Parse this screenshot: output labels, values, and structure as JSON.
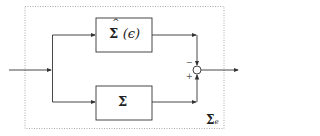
{
  "diagram": {
    "outer_label": "Σ",
    "outer_label_sub": "e",
    "top_block": {
      "symbol": "Σ",
      "hat": "^",
      "arg": "(ϵ)"
    },
    "bottom_block": {
      "symbol": "Σ"
    },
    "junction": {
      "top_sign": "−",
      "bottom_sign": "+"
    }
  },
  "colors": {
    "line": "#333333",
    "dashed": "#999999"
  }
}
